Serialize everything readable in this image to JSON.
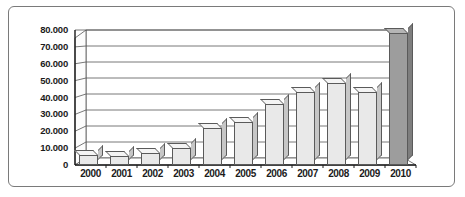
{
  "chart_data": {
    "type": "bar",
    "title": "",
    "subtitle": "",
    "xlabel": "",
    "ylabel": "",
    "categories": [
      "2000",
      "2001",
      "2002",
      "2003",
      "2004",
      "2005",
      "2006",
      "2007",
      "2008",
      "2009",
      "2010"
    ],
    "values": [
      6000,
      5500,
      7000,
      10000,
      22000,
      25500,
      36000,
      43000,
      48500,
      43000,
      78000
    ],
    "ytick_labels": [
      "0",
      "10.000",
      "20.000",
      "30.000",
      "40.000",
      "50.000",
      "60.000",
      "70.000",
      "80.000"
    ],
    "ytick_values": [
      0,
      10000,
      20000,
      30000,
      40000,
      50000,
      60000,
      70000,
      80000
    ],
    "ylim": [
      0,
      80000
    ],
    "grid": true,
    "legend": "none",
    "style": "3d-column",
    "colors": {
      "bar_fill": "#e9e9e9",
      "bar_highlight_fill": "#9d9d9d",
      "bar_outline": "#5a5a5a",
      "gridline": "#555555",
      "axis": "#1b1b1b",
      "frame_border": "#7a7a7a",
      "background": "#ffffff"
    },
    "highlighted_category": "2010"
  }
}
